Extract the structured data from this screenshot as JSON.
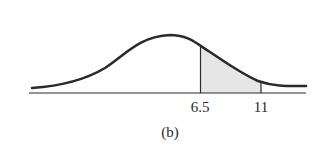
{
  "figure": {
    "caption": "(b)",
    "type": "normal distribution curve with shaded region",
    "markers": [
      {
        "label": "6.5",
        "x": 200
      },
      {
        "label": "11",
        "x": 261
      }
    ],
    "shaded_region": {
      "from": "6.5",
      "to": "11"
    },
    "colors": {
      "curve": "#2a2a2a",
      "shade": "#e6e6e6",
      "axis": "#2a2a2a"
    }
  }
}
